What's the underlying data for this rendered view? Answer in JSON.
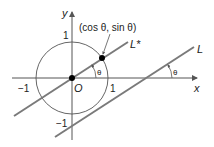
{
  "diagram": {
    "axes": {
      "x_label": "x",
      "y_label": "y",
      "origin_label": "O"
    },
    "ticks": {
      "x_pos": "1",
      "x_neg": "−1",
      "y_pos": "1",
      "y_neg": "−1"
    },
    "point_label": "(cos θ, sin θ)",
    "lines": {
      "l_star": "L*",
      "l": "L"
    },
    "angle_label": "θ",
    "colors": {
      "lines": "#7a7a7a",
      "axes": "#555555",
      "circle": "#555555",
      "points": "#000000"
    }
  }
}
